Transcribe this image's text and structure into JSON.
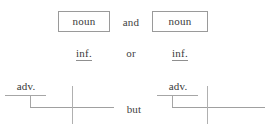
{
  "diagram": {
    "type": "sentence-diagram-template",
    "rows": {
      "row1": {
        "left_term": "noun",
        "conjunction": "and",
        "right_term": "noun"
      },
      "row2": {
        "left_term": "inf.",
        "conjunction": "or",
        "right_term": "inf."
      },
      "row3": {
        "left_modifier": "adv.",
        "conjunction": "but",
        "right_modifier": "adv."
      }
    },
    "colors": {
      "text": "#3a3a3a",
      "box_border": "#9a9a9a",
      "rule": "#a6a6a6",
      "background": "#ffffff"
    }
  }
}
